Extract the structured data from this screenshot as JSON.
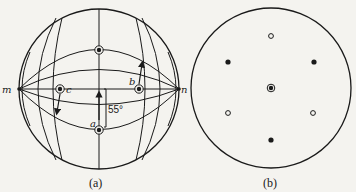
{
  "figure_a": {
    "caption": "(a)",
    "pole_left_label": "m",
    "pole_right_label": "n",
    "point_labels": {
      "a": "a",
      "b": "b",
      "c": "c"
    },
    "angle_label": "55°"
  },
  "figure_b": {
    "caption": "(b)"
  },
  "colors": {
    "ink": "#1a1a1a",
    "paper": "#f4f3ef"
  }
}
